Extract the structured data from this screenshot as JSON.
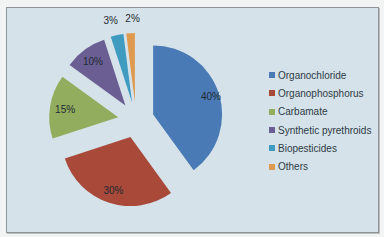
{
  "chart_data": {
    "type": "pie",
    "title": "",
    "exploded": true,
    "categories": [
      "Organochloride",
      "Organophosphorus",
      "Carbamate",
      "Synthetic pyrethroids",
      "Biopesticides",
      "Others"
    ],
    "values": [
      40,
      30,
      15,
      10,
      3,
      2
    ],
    "labels": [
      "40%",
      "30%",
      "15%",
      "10%",
      "3%",
      "2%"
    ],
    "colors": [
      "#4a7ab5",
      "#a8493a",
      "#93ad5e",
      "#6a5e92",
      "#3f9bbf",
      "#e09a50"
    ],
    "legend_position": "right"
  },
  "legend": {
    "items": [
      {
        "label": "Organochloride",
        "color": "#4a7ab5"
      },
      {
        "label": "Organophosphorus",
        "color": "#a8493a"
      },
      {
        "label": "Carbamate",
        "color": "#93ad5e"
      },
      {
        "label": "Synthetic pyrethroids",
        "color": "#6a5e92"
      },
      {
        "label": "Biopesticides",
        "color": "#3f9bbf"
      },
      {
        "label": "Others",
        "color": "#e09a50"
      }
    ]
  }
}
